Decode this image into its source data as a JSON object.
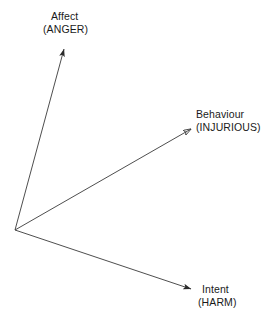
{
  "diagram": {
    "type": "vector-triad",
    "background_color": "#ffffff",
    "line_color": "#3a3a3a",
    "text_color": "#1a1a1a",
    "origin": {
      "x": 15,
      "y": 230
    },
    "vectors": [
      {
        "id": "affect",
        "name": "Affect",
        "qualifier": "(ANGER)",
        "arrow_name": "affect-arrow",
        "tip": {
          "x": 64,
          "y": 47
        },
        "label_position": "above-tip"
      },
      {
        "id": "behaviour",
        "name": "Behaviour",
        "qualifier": "(INJURIOUS)",
        "arrow_name": "behaviour-arrow",
        "tip": {
          "x": 193,
          "y": 128
        },
        "label_position": "right-of-tip"
      },
      {
        "id": "intent",
        "name": "Intent",
        "qualifier": "(HARM)",
        "arrow_name": "intent-arrow",
        "tip": {
          "x": 193,
          "y": 290
        },
        "label_position": "right-of-tip"
      }
    ]
  }
}
